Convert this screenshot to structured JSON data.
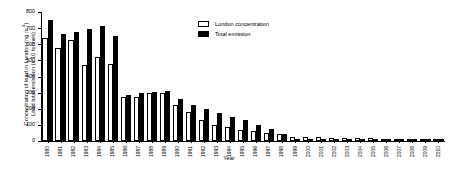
{
  "chart_data": {
    "type": "bar",
    "title": "",
    "xlabel": "Year",
    "ylabel_line1": "Concentration of lead in London (ng m",
    "ylabel_line1_sup": "-3",
    "ylabel_line1_end": ")",
    "ylabel_line2": "Lead total emission (x 10 tonnes)",
    "ylim": [
      0,
      800
    ],
    "yticks": [
      0,
      100,
      200,
      300,
      400,
      500,
      600,
      700,
      800
    ],
    "ytick_labels": [
      "0",
      "100",
      "200",
      "300",
      "400",
      "500",
      "600",
      "700",
      "800"
    ],
    "grid": false,
    "legend_position": "top-center-right",
    "categories": [
      "1980",
      "1981",
      "1982",
      "1983",
      "1984",
      "1985",
      "1986",
      "1987",
      "1988",
      "1989",
      "1990",
      "1991",
      "1992",
      "1993",
      "1994",
      "1995",
      "1996",
      "1997",
      "1998",
      "1999",
      "2000",
      "2001",
      "2002",
      "2003",
      "2004",
      "2005",
      "2006",
      "2007",
      "2008",
      "2009",
      "2010"
    ],
    "series": [
      {
        "name": "London concentration",
        "color": "#ffffff",
        "edge_color": "#000000",
        "values": [
          640,
          578,
          628,
          470,
          518,
          478,
          270,
          275,
          295,
          300,
          222,
          180,
          132,
          98,
          88,
          70,
          60,
          52,
          42,
          28,
          26,
          22,
          20,
          19,
          17,
          16,
          15,
          14,
          13,
          12,
          11
        ]
      },
      {
        "name": "Total emission",
        "color": "#000000",
        "edge_color": "#000000",
        "values": [
          748,
          665,
          678,
          692,
          715,
          650,
          285,
          295,
          305,
          312,
          262,
          222,
          196,
          172,
          150,
          128,
          98,
          76,
          42,
          12,
          6,
          5,
          4,
          4,
          3,
          3,
          3,
          2,
          2,
          2,
          2
        ]
      }
    ]
  },
  "legend": {
    "items": [
      {
        "label": "London concentration",
        "style": "white"
      },
      {
        "label": "Total emission",
        "style": "black"
      }
    ]
  },
  "axis": {
    "x_title": "Year"
  }
}
